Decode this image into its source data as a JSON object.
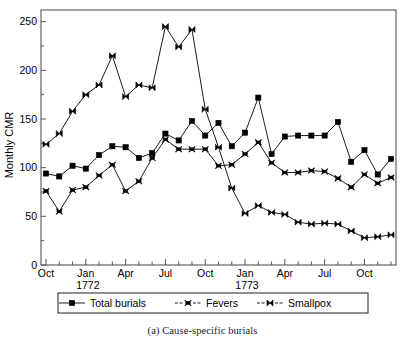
{
  "caption": "(a) Cause-specific burials",
  "chart_data": {
    "type": "line",
    "title": "",
    "xlabel": "",
    "ylabel": "Monthly CMR",
    "ylim": [
      0,
      262
    ],
    "yticks": [
      0,
      50,
      100,
      150,
      200,
      250
    ],
    "ytick_labels": [
      "0",
      "50",
      "100",
      "150",
      "200",
      "250"
    ],
    "grid": false,
    "legend_position": "below-axes",
    "x": [
      "Oct 1771",
      "Nov 1771",
      "Dec 1771",
      "Jan 1772",
      "Feb 1772",
      "Mar 1772",
      "Apr 1772",
      "May 1772",
      "Jun 1772",
      "Jul 1772",
      "Aug 1772",
      "Sep 1772",
      "Oct 1772",
      "Nov 1772",
      "Dec 1772",
      "Jan 1773",
      "Feb 1773",
      "Mar 1773",
      "Apr 1773",
      "May 1773",
      "Jun 1773",
      "Jul 1773",
      "Aug 1773",
      "Sep 1773",
      "Oct 1773",
      "Nov 1773",
      "Dec 1773"
    ],
    "x_tick_labels": [
      "Oct",
      "",
      "",
      "Jan",
      "",
      "",
      "Apr",
      "",
      "",
      "Jul",
      "",
      "",
      "Oct",
      "",
      "",
      "Jan",
      "",
      "",
      "Apr",
      "",
      "",
      "Jul",
      "",
      "",
      "Oct",
      "",
      ""
    ],
    "year_annotations": [
      {
        "label": "1772",
        "x_index": 3
      },
      {
        "label": "1773",
        "x_index": 15
      }
    ],
    "series": [
      {
        "name": "Total burials",
        "marker": "square",
        "values": [
          94,
          91,
          102,
          99,
          113,
          122,
          121,
          110,
          115,
          135,
          128,
          148,
          133,
          146,
          122,
          136,
          172,
          114,
          132,
          133,
          133,
          133,
          147,
          106,
          118,
          93,
          109
        ]
      },
      {
        "name": "Fevers",
        "marker": "star",
        "values": [
          76,
          55,
          77,
          80,
          92,
          103,
          76,
          86,
          110,
          129,
          119,
          119,
          119,
          102,
          103,
          114,
          126,
          105,
          95,
          95,
          97,
          96,
          89,
          80,
          93,
          84,
          90
        ]
      },
      {
        "name": "Smallpox",
        "marker": "bowtie",
        "values": [
          124,
          135,
          158,
          175,
          185,
          215,
          173,
          185,
          182,
          245,
          224,
          242,
          160,
          121,
          79,
          53,
          61,
          54,
          52,
          44,
          42,
          43,
          42,
          35,
          28,
          29,
          31
        ]
      }
    ]
  },
  "legend": {
    "items": [
      {
        "label": "Total burials",
        "marker": "square"
      },
      {
        "label": "Fevers",
        "marker": "star"
      },
      {
        "label": "Smallpox",
        "marker": "bowtie"
      }
    ]
  }
}
